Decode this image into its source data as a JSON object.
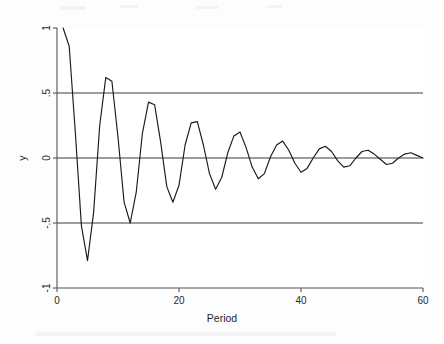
{
  "figure": {
    "background_color": "#fdfdfd",
    "plot_background_color": "#ffffff",
    "line_color": "#1a1a1a",
    "axis_color": "#555555",
    "reference_line_color": "#3a3a3a"
  },
  "chart_data": {
    "type": "line",
    "title": "",
    "subtitle": "",
    "xlabel": "Period",
    "ylabel": "y",
    "xlim": [
      0,
      60
    ],
    "ylim": [
      -1,
      1
    ],
    "grid": false,
    "legend": null,
    "legend_position": "none",
    "xticks": [
      0,
      20,
      40,
      60
    ],
    "xtick_labels": [
      "0",
      "20",
      "40",
      "60"
    ],
    "yticks": [
      -1,
      -0.5,
      0,
      0.5,
      1
    ],
    "ytick_labels": [
      "-1",
      "-.5",
      "0",
      ".5",
      "1"
    ],
    "annotations": [],
    "reference_lines": [
      {
        "axis": "y",
        "value": 0.5,
        "label": ".5"
      },
      {
        "axis": "y",
        "value": 0,
        "label": "0"
      },
      {
        "axis": "y",
        "value": -0.5,
        "label": "-.5"
      }
    ],
    "series": [
      {
        "name": "y",
        "x": [
          1,
          2,
          3,
          4,
          5,
          6,
          7,
          8,
          9,
          10,
          11,
          12,
          13,
          14,
          15,
          16,
          17,
          18,
          19,
          20,
          21,
          22,
          23,
          24,
          25,
          26,
          27,
          28,
          29,
          30,
          31,
          32,
          33,
          34,
          35,
          36,
          37,
          38,
          39,
          40,
          41,
          42,
          43,
          44,
          45,
          46,
          47,
          48,
          49,
          50,
          51,
          52,
          53,
          54,
          55,
          56,
          57,
          58,
          59,
          60
        ],
        "values": [
          1.0,
          0.86,
          0.2,
          -0.52,
          -0.79,
          -0.42,
          0.25,
          0.62,
          0.59,
          0.16,
          -0.34,
          -0.5,
          -0.26,
          0.19,
          0.43,
          0.41,
          0.12,
          -0.22,
          -0.34,
          -0.21,
          0.1,
          0.27,
          0.28,
          0.1,
          -0.12,
          -0.24,
          -0.15,
          0.04,
          0.17,
          0.2,
          0.08,
          -0.07,
          -0.16,
          -0.12,
          0.01,
          0.1,
          0.13,
          0.06,
          -0.04,
          -0.11,
          -0.08,
          0.0,
          0.07,
          0.09,
          0.05,
          -0.02,
          -0.07,
          -0.06,
          0.0,
          0.05,
          0.06,
          0.03,
          -0.01,
          -0.05,
          -0.04,
          0.0,
          0.03,
          0.04,
          0.02,
          0.0
        ]
      }
    ]
  }
}
